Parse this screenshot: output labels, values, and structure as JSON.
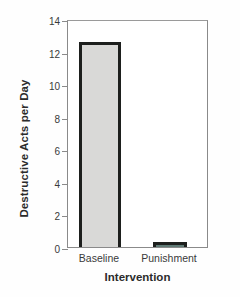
{
  "chart_data": {
    "type": "bar",
    "title": "",
    "xlabel": "Intervention",
    "ylabel": "Destructive Acts per Day",
    "categories": [
      "Baseline",
      "Punishment"
    ],
    "values": [
      12.6,
      0.3
    ],
    "ylim": [
      0,
      14
    ],
    "yticks": [
      0,
      2,
      4,
      6,
      8,
      10,
      12,
      14
    ],
    "ytick_labels": [
      "0",
      "2",
      "4",
      "6",
      "8",
      "10",
      "12",
      "14"
    ],
    "grid": false,
    "legend": false,
    "colors": {
      "baseline_fill": "#d9d9d7",
      "punishment_fill": "#5f7a75",
      "bar_edge": "#1d1f1d",
      "axis": "#8a8a8a",
      "text": "#2b2b2b",
      "background": "#fefefe"
    }
  }
}
